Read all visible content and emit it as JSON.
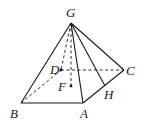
{
  "diagram": {
    "type": "pyramid",
    "points": {
      "G": {
        "label": "G",
        "x": 71,
        "y": 23
      },
      "D": {
        "label": "D",
        "x": 61,
        "y": 70
      },
      "C": {
        "label": "C",
        "x": 124,
        "y": 70
      },
      "F": {
        "label": "F",
        "x": 71,
        "y": 86
      },
      "B": {
        "label": "B",
        "x": 21,
        "y": 103
      },
      "A": {
        "label": "A",
        "x": 83,
        "y": 103
      },
      "H": {
        "label": "H",
        "x": 105,
        "y": 86
      }
    },
    "solid_edges": [
      [
        "G",
        "B"
      ],
      [
        "G",
        "A"
      ],
      [
        "G",
        "C"
      ],
      [
        "G",
        "H"
      ],
      [
        "B",
        "A"
      ],
      [
        "A",
        "C"
      ]
    ],
    "dashed_edges": [
      [
        "B",
        "D"
      ],
      [
        "D",
        "C"
      ],
      [
        "G",
        "D"
      ],
      [
        "G",
        "F"
      ]
    ],
    "stroke_color": "#1a1a1a"
  }
}
